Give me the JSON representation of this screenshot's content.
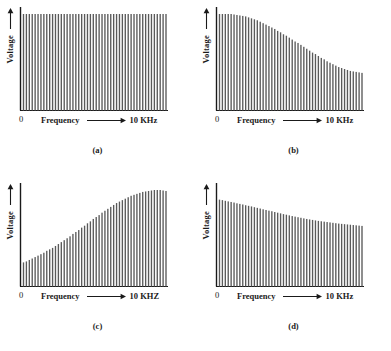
{
  "figure": {
    "background_color": "#ffffff",
    "ink_color": "#1a1a1a",
    "bar_color": "#5a5a5a",
    "panels": [
      {
        "id": "a",
        "caption": "(a)",
        "ylabel": "Voltage",
        "xlabel": "Frequency",
        "x_origin_label": "0",
        "x_max_label": "10 KHz"
      },
      {
        "id": "b",
        "caption": "(b)",
        "ylabel": "Voltage",
        "xlabel": "Frequency",
        "x_origin_label": "0",
        "x_max_label": "10 KHz"
      },
      {
        "id": "c",
        "caption": "(c)",
        "ylabel": "Voltage",
        "xlabel": "Frequency",
        "x_origin_label": "0",
        "x_max_label": "10 KHZ"
      },
      {
        "id": "d",
        "caption": "(d)",
        "ylabel": "Voltage",
        "xlabel": "Frequency",
        "x_origin_label": "0",
        "x_max_label": "10 KHz"
      }
    ]
  },
  "chart_data": [
    {
      "type": "bar",
      "id": "a",
      "title": "(a)",
      "xlabel": "Frequency",
      "ylabel": "Voltage",
      "xlim": [
        0,
        10
      ],
      "ylim": [
        0,
        1
      ],
      "x_unit": "KHz",
      "grid": false,
      "legend": null,
      "description": "Flat spectrum: all harmonic line amplitudes equal across 0 to 10 KHz",
      "x": [
        0.1,
        0.3,
        0.5,
        0.7,
        0.9,
        1.1,
        1.3,
        1.5,
        1.7,
        1.9,
        2.1,
        2.3,
        2.5,
        2.7,
        2.9,
        3.1,
        3.3,
        3.5,
        3.7,
        3.9,
        4.1,
        4.3,
        4.5,
        4.7,
        4.9,
        5.1,
        5.3,
        5.5,
        5.7,
        5.9,
        6.1,
        6.3,
        6.5,
        6.7,
        6.9,
        7.1,
        7.3,
        7.5,
        7.7,
        7.9,
        8.1,
        8.3,
        8.5,
        8.7,
        8.9,
        9.1,
        9.3,
        9.5,
        9.7,
        9.9
      ],
      "values": [
        1,
        1,
        1,
        1,
        1,
        1,
        1,
        1,
        1,
        1,
        1,
        1,
        1,
        1,
        1,
        1,
        1,
        1,
        1,
        1,
        1,
        1,
        1,
        1,
        1,
        1,
        1,
        1,
        1,
        1,
        1,
        1,
        1,
        1,
        1,
        1,
        1,
        1,
        1,
        1,
        1,
        1,
        1,
        1,
        1,
        1,
        1,
        1,
        1,
        1
      ]
    },
    {
      "type": "bar",
      "id": "b",
      "title": "(b)",
      "xlabel": "Frequency",
      "ylabel": "Voltage",
      "xlim": [
        0,
        10
      ],
      "ylim": [
        0,
        1
      ],
      "x_unit": "KHz",
      "grid": false,
      "legend": null,
      "description": "High-frequency roll-off: flat near DC then falling to about 40 percent at 10 KHz",
      "x": [
        0.1,
        0.3,
        0.5,
        0.7,
        0.9,
        1.1,
        1.3,
        1.5,
        1.7,
        1.9,
        2.1,
        2.3,
        2.5,
        2.7,
        2.9,
        3.1,
        3.3,
        3.5,
        3.7,
        3.9,
        4.1,
        4.3,
        4.5,
        4.7,
        4.9,
        5.1,
        5.3,
        5.5,
        5.7,
        5.9,
        6.1,
        6.3,
        6.5,
        6.7,
        6.9,
        7.1,
        7.3,
        7.5,
        7.7,
        7.9,
        8.1,
        8.3,
        8.5,
        8.7,
        8.9,
        9.1,
        9.3,
        9.5,
        9.7,
        9.9
      ],
      "values": [
        1.0,
        1.0,
        1.0,
        1.0,
        1.0,
        0.995,
        0.99,
        0.985,
        0.98,
        0.975,
        0.965,
        0.955,
        0.945,
        0.935,
        0.92,
        0.905,
        0.89,
        0.875,
        0.86,
        0.845,
        0.825,
        0.81,
        0.79,
        0.775,
        0.755,
        0.735,
        0.715,
        0.7,
        0.68,
        0.66,
        0.64,
        0.62,
        0.6,
        0.585,
        0.565,
        0.545,
        0.53,
        0.51,
        0.495,
        0.48,
        0.465,
        0.45,
        0.44,
        0.43,
        0.42,
        0.41,
        0.405,
        0.4,
        0.395,
        0.39
      ]
    },
    {
      "type": "bar",
      "id": "c",
      "title": "(c)",
      "xlabel": "Frequency",
      "ylabel": "Voltage",
      "xlim": [
        0,
        10
      ],
      "ylim": [
        0,
        1
      ],
      "x_unit": "KHZ",
      "grid": false,
      "legend": null,
      "description": "Low-frequency roll-off: rising S-curve from about 25 percent to full amplitude near 10 KHZ",
      "x": [
        0.1,
        0.3,
        0.5,
        0.7,
        0.9,
        1.1,
        1.3,
        1.5,
        1.7,
        1.9,
        2.1,
        2.3,
        2.5,
        2.7,
        2.9,
        3.1,
        3.3,
        3.5,
        3.7,
        3.9,
        4.1,
        4.3,
        4.5,
        4.7,
        4.9,
        5.1,
        5.3,
        5.5,
        5.7,
        5.9,
        6.1,
        6.3,
        6.5,
        6.7,
        6.9,
        7.1,
        7.3,
        7.5,
        7.7,
        7.9,
        8.1,
        8.3,
        8.5,
        8.7,
        8.9,
        9.1,
        9.3,
        9.5,
        9.7,
        9.9
      ],
      "values": [
        0.25,
        0.26,
        0.275,
        0.29,
        0.305,
        0.32,
        0.335,
        0.35,
        0.37,
        0.385,
        0.4,
        0.42,
        0.44,
        0.46,
        0.48,
        0.5,
        0.52,
        0.545,
        0.565,
        0.585,
        0.61,
        0.63,
        0.655,
        0.675,
        0.7,
        0.72,
        0.74,
        0.765,
        0.785,
        0.805,
        0.825,
        0.845,
        0.865,
        0.88,
        0.895,
        0.91,
        0.925,
        0.94,
        0.95,
        0.96,
        0.97,
        0.98,
        0.985,
        0.99,
        0.995,
        1.0,
        1.0,
        1.0,
        0.995,
        0.99
      ]
    },
    {
      "type": "bar",
      "id": "d",
      "title": "(d)",
      "xlabel": "Frequency",
      "ylabel": "Voltage",
      "xlim": [
        0,
        10
      ],
      "ylim": [
        0,
        1
      ],
      "x_unit": "KHz",
      "grid": false,
      "legend": null,
      "description": "Gentle downward-sloping spectrum with slight ripple, from about 90 percent to 62 percent",
      "x": [
        0.1,
        0.3,
        0.5,
        0.7,
        0.9,
        1.1,
        1.3,
        1.5,
        1.7,
        1.9,
        2.1,
        2.3,
        2.5,
        2.7,
        2.9,
        3.1,
        3.3,
        3.5,
        3.7,
        3.9,
        4.1,
        4.3,
        4.5,
        4.7,
        4.9,
        5.1,
        5.3,
        5.5,
        5.7,
        5.9,
        6.1,
        6.3,
        6.5,
        6.7,
        6.9,
        7.1,
        7.3,
        7.5,
        7.7,
        7.9,
        8.1,
        8.3,
        8.5,
        8.7,
        8.9,
        9.1,
        9.3,
        9.5,
        9.7,
        9.9
      ],
      "values": [
        0.9,
        0.895,
        0.888,
        0.882,
        0.876,
        0.87,
        0.862,
        0.856,
        0.85,
        0.842,
        0.836,
        0.83,
        0.822,
        0.815,
        0.808,
        0.8,
        0.793,
        0.786,
        0.78,
        0.772,
        0.765,
        0.758,
        0.75,
        0.744,
        0.737,
        0.73,
        0.724,
        0.718,
        0.712,
        0.706,
        0.7,
        0.695,
        0.69,
        0.685,
        0.68,
        0.676,
        0.672,
        0.668,
        0.664,
        0.66,
        0.656,
        0.652,
        0.649,
        0.646,
        0.643,
        0.64,
        0.637,
        0.634,
        0.631,
        0.628
      ]
    }
  ]
}
